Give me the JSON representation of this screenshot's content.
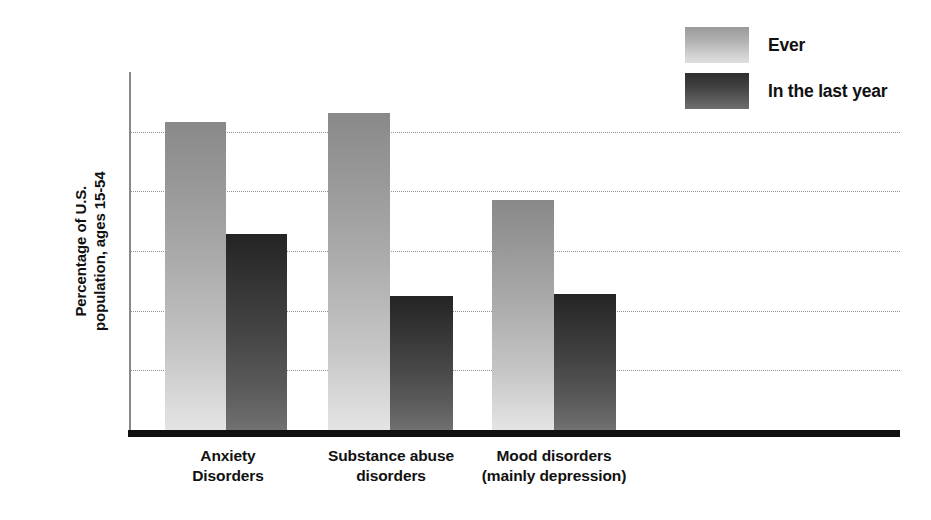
{
  "chart_data": {
    "type": "bar",
    "title": "",
    "xlabel": "",
    "ylabel": "Percentage of U.S.\npopulation, ages 15-54",
    "ylabel_line1": "Percentage of U.S.",
    "ylabel_line2": "population, ages 15-54",
    "categories": [
      "Anxiety\nDisorders",
      "Substance abuse\ndisorders",
      "Mood disorders\n(mainly depression)"
    ],
    "category_lines": [
      [
        "Anxiety",
        "Disorders"
      ],
      [
        "Substance abuse",
        "disorders"
      ],
      [
        "Mood disorders",
        "(mainly depression)"
      ]
    ],
    "series": [
      {
        "name": "Ever",
        "values": [
          25.8,
          26.6,
          19.3
        ],
        "color": "#b0b0b0"
      },
      {
        "name": "In the last year",
        "values": [
          16.4,
          11.2,
          11.4
        ],
        "color": "#434343"
      }
    ],
    "legend": [
      "Ever",
      "In the last year"
    ],
    "legend_position": "top-right",
    "ylim": [
      0,
      30
    ],
    "yticks": [
      0,
      5,
      10,
      15,
      20,
      25,
      30
    ],
    "ytick_labels": [
      "0",
      "5",
      "10",
      "15",
      "20",
      "25",
      "30"
    ],
    "grid": true,
    "grid_style": "dotted-horizontal"
  },
  "colors": {
    "axis": "#111111",
    "grid": "#8f8f8f",
    "ever_light": "#e4e4e4",
    "ever_dark": "#898989",
    "lastyear_light": "#727272",
    "lastyear_dark": "#242424"
  }
}
